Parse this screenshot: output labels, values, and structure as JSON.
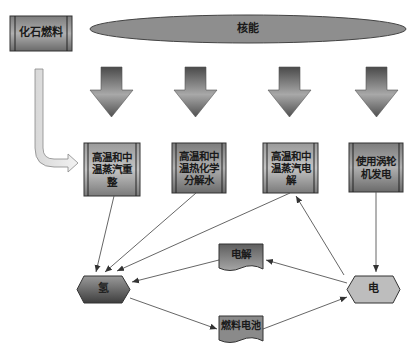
{
  "diagram": {
    "sources": {
      "fossil_fuel": "化石燃料",
      "nuclear": "核能"
    },
    "processes": [
      {
        "id": "p1",
        "label": "高温和中温蒸汽重整"
      },
      {
        "id": "p2",
        "label": "高温和中温热化学分解水"
      },
      {
        "id": "p3",
        "label": "高温和中温蒸汽电解"
      },
      {
        "id": "p4",
        "label": "使用涡轮机发电"
      }
    ],
    "products": {
      "hydrogen": "氢",
      "electricity": "电"
    },
    "converters": {
      "electrolysis": "电解",
      "fuel_cell": "燃料电池"
    },
    "edges": [
      {
        "from": "化石燃料",
        "to": "高温和中温蒸汽重整"
      },
      {
        "from": "核能",
        "to": "高温和中温蒸汽重整"
      },
      {
        "from": "核能",
        "to": "高温和中温热化学分解水"
      },
      {
        "from": "核能",
        "to": "高温和中温蒸汽电解"
      },
      {
        "from": "核能",
        "to": "使用涡轮机发电"
      },
      {
        "from": "高温和中温蒸汽重整",
        "to": "氢"
      },
      {
        "from": "高温和中温热化学分解水",
        "to": "氢"
      },
      {
        "from": "高温和中温蒸汽电解",
        "to": "氢"
      },
      {
        "from": "使用涡轮机发电",
        "to": "电"
      },
      {
        "from": "电",
        "to": "高温和中温蒸汽电解"
      },
      {
        "from": "电",
        "to": "电解"
      },
      {
        "from": "电解",
        "to": "氢"
      },
      {
        "from": "氢",
        "to": "燃料电池"
      },
      {
        "from": "燃料电池",
        "to": "电"
      }
    ],
    "colors": {
      "box_fill_light": "#b8b8b8",
      "box_fill_dark": "#6e6e6e",
      "ellipse_fill": "#8c8c8c",
      "line": "#555555",
      "electricity_fill": "#bdbdbd"
    }
  }
}
